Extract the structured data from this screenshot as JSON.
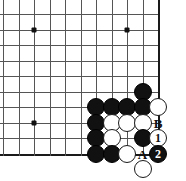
{
  "diagram": {
    "kind": "go-board-corner-diagram",
    "board_width_px": 186,
    "board_height_px": 181,
    "background_color": "#ffffff",
    "grid": {
      "line_color": "#555555",
      "edge_line_color": "#1a1a1a",
      "cell_size_px": 15.5,
      "origin_x_px": 3,
      "origin_y_px": 14,
      "columns": 11,
      "rows": 10,
      "right_edge_index": 10,
      "bottom_edge_index": 9
    },
    "star_points": [
      {
        "name": "star-point-upper-left",
        "col": 2,
        "row": 1
      },
      {
        "name": "star-point-upper-right",
        "col": 8,
        "row": 1
      },
      {
        "name": "star-point-lower-left",
        "col": 2,
        "row": 7
      }
    ],
    "stones": [
      {
        "id": "black-1",
        "color": "black",
        "col": 9,
        "row": 5
      },
      {
        "id": "black-2",
        "color": "black",
        "col": 6,
        "row": 6
      },
      {
        "id": "black-3",
        "color": "black",
        "col": 7,
        "row": 6
      },
      {
        "id": "black-4",
        "color": "black",
        "col": 8,
        "row": 6
      },
      {
        "id": "black-5",
        "color": "black",
        "col": 9,
        "row": 6
      },
      {
        "id": "white-1",
        "color": "white",
        "col": 10,
        "row": 6
      },
      {
        "id": "black-6",
        "color": "black",
        "col": 6,
        "row": 7
      },
      {
        "id": "white-2",
        "color": "white",
        "col": 7,
        "row": 7
      },
      {
        "id": "white-3",
        "color": "white",
        "col": 8,
        "row": 7
      },
      {
        "id": "white-4",
        "color": "white",
        "col": 9,
        "row": 7
      },
      {
        "id": "black-7",
        "color": "black",
        "col": 6,
        "row": 8
      },
      {
        "id": "white-5",
        "color": "white",
        "col": 7,
        "row": 8
      },
      {
        "id": "black-8",
        "color": "black",
        "col": 9,
        "row": 8
      },
      {
        "id": "black-9",
        "color": "black",
        "col": 6,
        "row": 9
      },
      {
        "id": "black-10",
        "color": "black",
        "col": 7,
        "row": 9
      },
      {
        "id": "white-6",
        "color": "white",
        "col": 8,
        "row": 9
      },
      {
        "id": "white-7",
        "color": "white",
        "col": 9,
        "row": 10
      }
    ],
    "numbered_moves": [
      {
        "id": "move-1",
        "number": "1",
        "color": "white",
        "col": 10,
        "row": 8
      },
      {
        "id": "move-2",
        "number": "2",
        "color": "black",
        "col": 10,
        "row": 9
      }
    ],
    "point_labels": [
      {
        "id": "label-B",
        "text": "B",
        "col": 10,
        "row": 7
      },
      {
        "id": "label-A",
        "text": "A",
        "col": 9,
        "row": 9
      }
    ]
  }
}
